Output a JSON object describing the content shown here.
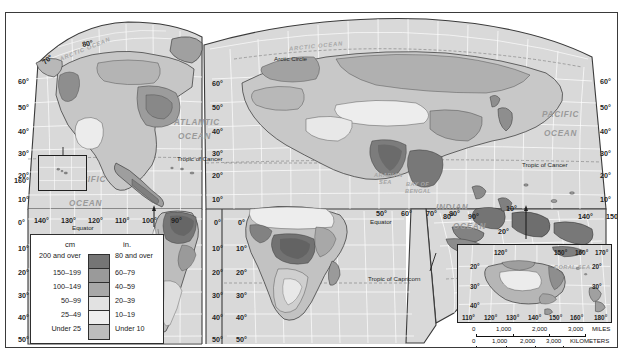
{
  "map": {
    "title": "World Precipitation Map",
    "projection_note": "MODIFIED GOODE'S HOMOLOSINE EQUAL-AREA PROJECTION",
    "background_color": "#d9d9d9",
    "frame_color": "#3a3a3a"
  },
  "legend": {
    "header_cm": "cm",
    "header_in": "in.",
    "rows": [
      {
        "cm": "200 and over",
        "in": "80 and over",
        "color": "#757575"
      },
      {
        "cm": "150–199",
        "in": "60–79",
        "color": "#9a9a9a"
      },
      {
        "cm": "100–149",
        "in": "40–59",
        "color": "#a8a8a8"
      },
      {
        "cm": "50–99",
        "in": "20–39",
        "color": "#e2e2e2"
      },
      {
        "cm": "25–49",
        "in": "10–19",
        "color": "#eeeeee"
      },
      {
        "cm": "Under 25",
        "in": "Under 10",
        "color": "#bdbdbd"
      }
    ]
  },
  "ocean_labels": [
    {
      "text": "ARCTIC OCEAN",
      "x": 52,
      "y": 33,
      "rot": -22,
      "size": "sm"
    },
    {
      "text": "ARCTIC OCEAN",
      "x": 283,
      "y": 30,
      "rot": -6,
      "size": "sm"
    },
    {
      "text": "ATLANTIC",
      "x": 168,
      "y": 105,
      "rot": 0,
      "size": "lg"
    },
    {
      "text": "OCEAN",
      "x": 172,
      "y": 119,
      "rot": 0,
      "size": "lg"
    },
    {
      "text": "PACIFIC",
      "x": 63,
      "y": 162,
      "rot": 0,
      "size": "lg"
    },
    {
      "text": "OCEAN",
      "x": 63,
      "y": 186,
      "rot": 0,
      "size": "lg"
    },
    {
      "text": "PACIFIC",
      "x": 536,
      "y": 97,
      "rot": 0,
      "size": "lg"
    },
    {
      "text": "OCEAN",
      "x": 538,
      "y": 116,
      "rot": 0,
      "size": "lg"
    },
    {
      "text": "INDIAN",
      "x": 430,
      "y": 190,
      "rot": 0,
      "size": "lg"
    },
    {
      "text": "OCEAN",
      "x": 447,
      "y": 209,
      "rot": 0,
      "size": "lg"
    },
    {
      "text": "BAY OF",
      "x": 400,
      "y": 168,
      "rot": 0,
      "size": "sm"
    },
    {
      "text": "BENGAL",
      "x": 399,
      "y": 175,
      "rot": 0,
      "size": "sm"
    },
    {
      "text": "ARABIAN",
      "x": 368,
      "y": 159,
      "rot": 0,
      "size": "sm"
    },
    {
      "text": "SEA",
      "x": 373,
      "y": 166,
      "rot": 0,
      "size": "sm"
    }
  ],
  "line_labels": [
    {
      "text": "Arctic Circle",
      "x": 268,
      "y": 42
    },
    {
      "text": "Tropic of Cancer",
      "x": 171,
      "y": 142
    },
    {
      "text": "Tropic of Cancer",
      "x": 516,
      "y": 148
    },
    {
      "text": "Equator",
      "x": 66,
      "y": 211
    },
    {
      "text": "Equator",
      "x": 364,
      "y": 205
    },
    {
      "text": "Tropic of Capricorn",
      "x": 362,
      "y": 262
    }
  ],
  "latitude_labels_left": [
    {
      "text": "60°",
      "x": 12,
      "y": 64
    },
    {
      "text": "50°",
      "x": 12,
      "y": 90
    },
    {
      "text": "40°",
      "x": 12,
      "y": 114
    },
    {
      "text": "30°",
      "x": 12,
      "y": 136
    },
    {
      "text": "20°",
      "x": 12,
      "y": 158
    },
    {
      "text": "10°",
      "x": 12,
      "y": 182
    },
    {
      "text": "0°",
      "x": 12,
      "y": 205
    },
    {
      "text": "10°",
      "x": 12,
      "y": 231
    },
    {
      "text": "20°",
      "x": 12,
      "y": 255
    },
    {
      "text": "30°",
      "x": 12,
      "y": 278
    },
    {
      "text": "40°",
      "x": 12,
      "y": 300
    },
    {
      "text": "50°",
      "x": 12,
      "y": 322
    }
  ],
  "curved_polar_labels": [
    {
      "text": "80°",
      "x": 76,
      "y": 26,
      "rot": -12
    },
    {
      "text": "70°",
      "x": 36,
      "y": 42,
      "rot": -42
    }
  ],
  "latitude_labels_midleft": [
    {
      "text": "60°",
      "x": 206,
      "y": 66
    },
    {
      "text": "50°",
      "x": 206,
      "y": 90
    },
    {
      "text": "40°",
      "x": 206,
      "y": 114
    },
    {
      "text": "30°",
      "x": 206,
      "y": 136
    },
    {
      "text": "20°",
      "x": 206,
      "y": 158
    },
    {
      "text": "10°",
      "x": 206,
      "y": 182
    },
    {
      "text": "0°",
      "x": 208,
      "y": 205
    },
    {
      "text": "10°",
      "x": 206,
      "y": 231
    },
    {
      "text": "20°",
      "x": 206,
      "y": 255
    },
    {
      "text": "30°",
      "x": 206,
      "y": 278
    },
    {
      "text": "40°",
      "x": 206,
      "y": 300
    },
    {
      "text": "50°",
      "x": 206,
      "y": 322
    }
  ],
  "latitude_labels_africa": [
    {
      "text": "0°",
      "x": 232,
      "y": 205
    },
    {
      "text": "10°",
      "x": 230,
      "y": 231
    },
    {
      "text": "20°",
      "x": 230,
      "y": 255
    },
    {
      "text": "30°",
      "x": 230,
      "y": 278
    },
    {
      "text": "40°",
      "x": 230,
      "y": 300
    },
    {
      "text": "50°",
      "x": 230,
      "y": 322
    }
  ],
  "latitude_labels_right": [
    {
      "text": "60°",
      "x": 594,
      "y": 64
    },
    {
      "text": "50°",
      "x": 594,
      "y": 90
    },
    {
      "text": "40°",
      "x": 594,
      "y": 114
    },
    {
      "text": "30°",
      "x": 594,
      "y": 136
    },
    {
      "text": "20°",
      "x": 594,
      "y": 158
    },
    {
      "text": "10°",
      "x": 594,
      "y": 182
    }
  ],
  "latitude_labels_indian": [
    {
      "text": "10°",
      "x": 500,
      "y": 191
    },
    {
      "text": "20°",
      "x": 492,
      "y": 214
    },
    {
      "text": "30°",
      "x": 483,
      "y": 238
    },
    {
      "text": "40°",
      "x": 472,
      "y": 262
    }
  ],
  "longitude_labels_americas": [
    {
      "text": "160°",
      "x": 8,
      "y": 163
    },
    {
      "text": "140°",
      "x": 28,
      "y": 203
    },
    {
      "text": "130°",
      "x": 55,
      "y": 203
    },
    {
      "text": "120°",
      "x": 82,
      "y": 203
    },
    {
      "text": "110°",
      "x": 109,
      "y": 203
    },
    {
      "text": "100°",
      "x": 136,
      "y": 203
    },
    {
      "text": "90°",
      "x": 165,
      "y": 203
    }
  ],
  "longitude_labels_afro": [
    {
      "text": "50°",
      "x": 370,
      "y": 196
    },
    {
      "text": "60°",
      "x": 395,
      "y": 196
    },
    {
      "text": "70°",
      "x": 420,
      "y": 196
    },
    {
      "text": "80°",
      "x": 443,
      "y": 196
    },
    {
      "text": "80°",
      "x": 437,
      "y": 199
    },
    {
      "text": "90°",
      "x": 462,
      "y": 199
    },
    {
      "text": "140°",
      "x": 572,
      "y": 199
    },
    {
      "text": "150°",
      "x": 600,
      "y": 199
    }
  ],
  "australia_inset": {
    "sea_label": "CORAL SEA",
    "top_labels": [
      {
        "text": "120°",
        "x": 36,
        "y": 4
      },
      {
        "text": "150°",
        "x": 96,
        "y": 4
      },
      {
        "text": "160°",
        "x": 117,
        "y": 4
      },
      {
        "text": "170°",
        "x": 137,
        "y": 4
      }
    ],
    "side_labels": [
      {
        "text": "20°",
        "x": 12,
        "y": 18
      },
      {
        "text": "30°",
        "x": 12,
        "y": 38
      },
      {
        "text": "40°",
        "x": 12,
        "y": 57
      },
      {
        "text": "20°",
        "x": 134,
        "y": 18
      },
      {
        "text": "30°",
        "x": 134,
        "y": 38
      }
    ],
    "bottom_labels": [
      {
        "text": "110°",
        "x": 4,
        "y": 69
      },
      {
        "text": "120°",
        "x": 26,
        "y": 69
      },
      {
        "text": "130°",
        "x": 48,
        "y": 69
      },
      {
        "text": "140°",
        "x": 70,
        "y": 69
      },
      {
        "text": "150°",
        "x": 91,
        "y": 69
      },
      {
        "text": "160°",
        "x": 112,
        "y": 69
      },
      {
        "text": "180°",
        "x": 136,
        "y": 69
      }
    ]
  },
  "scale": {
    "miles_ticks": [
      "0",
      "1,000",
      "2,000",
      "3,000"
    ],
    "miles_unit": "MILES",
    "km_ticks": [
      "0",
      "1,000",
      "2,000",
      "3,000"
    ],
    "km_unit": "KILOMETERS",
    "projection": "MODIFIED GOODE'S HOMOLOSINE EQUAL-AREA PROJECTION"
  }
}
